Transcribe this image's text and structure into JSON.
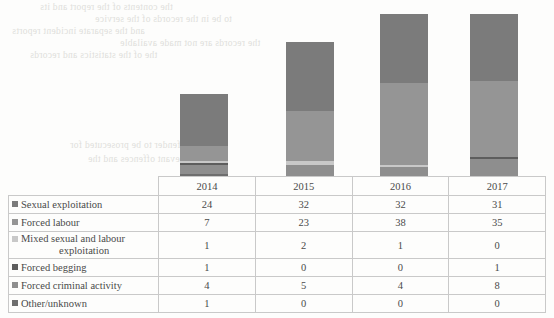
{
  "chart_data": {
    "type": "bar",
    "subtype": "stacked-column",
    "title": "",
    "xlabel": "",
    "ylabel": "",
    "grid": false,
    "legend_position": "table-row-labels",
    "categories": [
      "2014",
      "2015",
      "2016",
      "2017"
    ],
    "ylim": [
      0,
      80
    ],
    "totals": [
      38,
      62,
      75,
      75
    ],
    "series": [
      {
        "name": "Sexual exploitation",
        "color": "#7b7b7b",
        "values": [
          24,
          32,
          32,
          31
        ]
      },
      {
        "name": "Forced labour",
        "color": "#959595",
        "values": [
          7,
          23,
          38,
          35
        ]
      },
      {
        "name": "Mixed sexual and labour exploitation",
        "color": "#c8c8c8",
        "values": [
          1,
          2,
          1,
          0
        ]
      },
      {
        "name": "Forced begging",
        "color": "#5d5d5d",
        "values": [
          1,
          0,
          0,
          1
        ]
      },
      {
        "name": "Forced criminal activity",
        "color": "#8e8e8e",
        "values": [
          4,
          5,
          4,
          8
        ]
      },
      {
        "name": "Other/unknown",
        "color": "#6e6e6e",
        "values": [
          1,
          0,
          0,
          0
        ]
      }
    ]
  },
  "table": {
    "corner_label": "",
    "columns": [
      "2014",
      "2015",
      "2016",
      "2017"
    ],
    "rows": [
      {
        "label": "Sexual exploitation",
        "label_line2": "",
        "swatch": "#7b7b7b",
        "values": [
          "24",
          "32",
          "32",
          "31"
        ]
      },
      {
        "label": "Forced labour",
        "label_line2": "",
        "swatch": "#959595",
        "values": [
          "7",
          "23",
          "38",
          "35"
        ]
      },
      {
        "label": "Mixed sexual and labour",
        "label_line2": "exploitation",
        "swatch": "#c8c8c8",
        "values": [
          "1",
          "2",
          "1",
          "0"
        ]
      },
      {
        "label": "Forced begging",
        "label_line2": "",
        "swatch": "#5d5d5d",
        "values": [
          "1",
          "0",
          "0",
          "1"
        ]
      },
      {
        "label": "Forced criminal activity",
        "label_line2": "",
        "swatch": "#8e8e8e",
        "values": [
          "4",
          "5",
          "4",
          "8"
        ]
      },
      {
        "label": "Other/unknown",
        "label_line2": "",
        "swatch": "#6e6e6e",
        "values": [
          "1",
          "0",
          "0",
          "0"
        ]
      }
    ]
  },
  "background_text": {
    "note": "faint show-through text from reverse of scanned page (illegible)",
    "lines": [
      "the contents of the report and its",
      "to be in the records of the service",
      "and the separate incident reports",
      "the records are not made available",
      "the of the statistics and records",
      "the offender to be prosecuted for",
      "the relevant offences and the"
    ]
  }
}
